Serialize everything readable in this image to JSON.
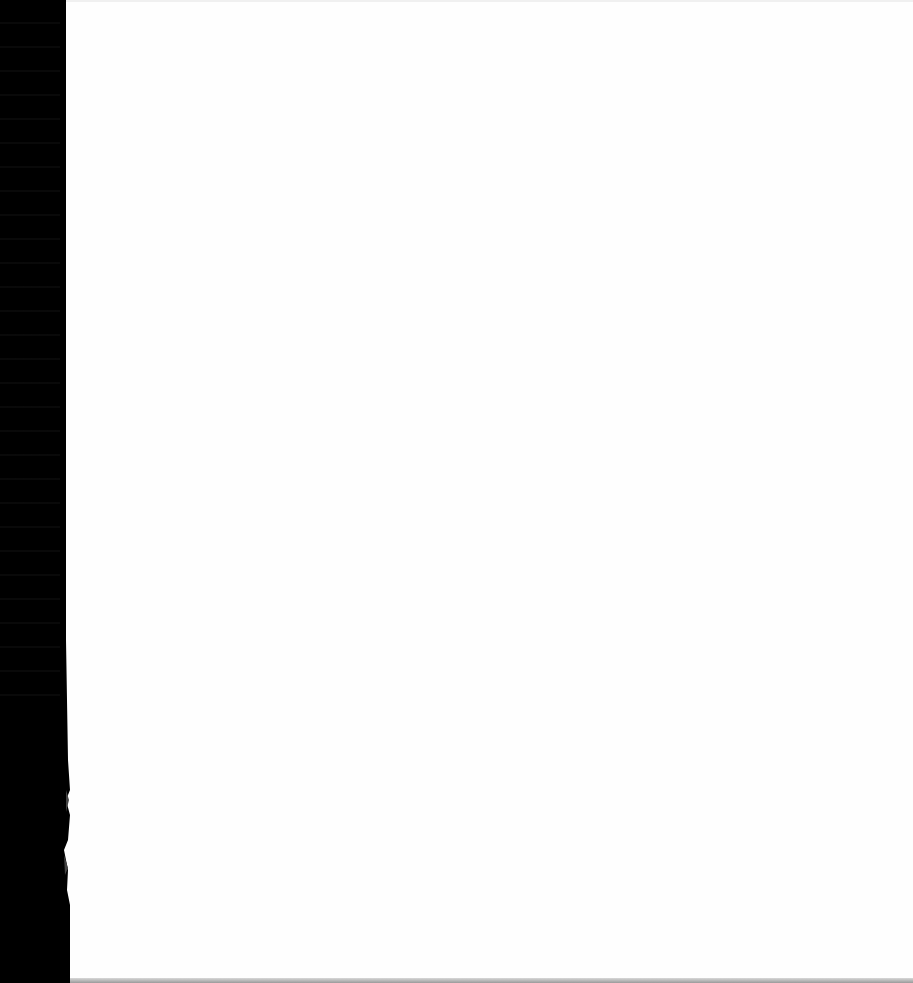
{
  "document": {
    "type": "scanned-page",
    "content": "",
    "colors": {
      "page": "#fefefe",
      "binding": "#000000",
      "bottom_edge": "#9a9a9a"
    }
  }
}
